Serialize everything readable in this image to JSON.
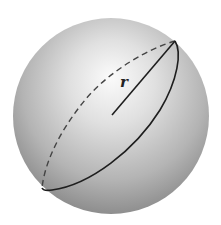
{
  "diagram": {
    "type": "sphere",
    "label": "r",
    "colors": {
      "background": "#ffffff",
      "sphere_highlight": "#fafafa",
      "sphere_mid": "#c8c8c8",
      "sphere_edge": "#8c8c8c",
      "line": "#1e1e1e"
    },
    "sphere": {
      "cx": 111,
      "cy": 116,
      "r": 98
    },
    "radius_line": {
      "x1": 112,
      "y1": 115,
      "x2": 175,
      "y2": 41
    },
    "great_circle": {
      "front_style": "solid",
      "back_style": "dashed"
    }
  }
}
